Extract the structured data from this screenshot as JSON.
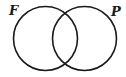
{
  "diagram": {
    "type": "venn",
    "sets": [
      {
        "label": "F",
        "cx": 45.5,
        "cy": 38.5,
        "r": 32
      },
      {
        "label": "P",
        "cx": 84.5,
        "cy": 38.5,
        "r": 32
      }
    ],
    "stroke_color": "#1a1a1a"
  }
}
